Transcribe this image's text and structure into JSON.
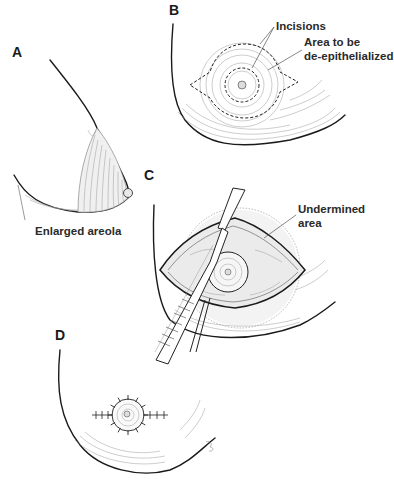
{
  "panels": {
    "a": {
      "label": "A",
      "caption": "Enlarged areola"
    },
    "b": {
      "label": "B",
      "annotations": {
        "incisions": "Incisions",
        "area_line1": "Area to be",
        "area_line2": "de-epithelialized"
      }
    },
    "c": {
      "label": "C",
      "annotations": {
        "undermined_line1": "Undermined",
        "undermined_line2": "area"
      }
    },
    "d": {
      "label": "D"
    }
  }
}
